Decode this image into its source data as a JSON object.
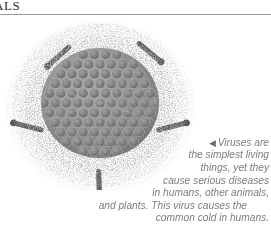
{
  "page": {
    "background_color": "#ffffff",
    "running_head": "ALS",
    "rule_color": "#9a9a9a"
  },
  "figure": {
    "name": "virus-illustration",
    "capsid_color": "#8a8a8a",
    "halo_color": "#b5b5b5",
    "capsomere_color": "#6f6f6f",
    "spike_color": "#555555",
    "spike_count": 5
  },
  "caption": {
    "arrow_glyph": "◀",
    "text_color": "#7c7c7c",
    "lines": [
      "Viruses are",
      "the simplest living",
      "things, yet they",
      "cause serious diseases",
      "in humans, other animals,",
      "and plants. This virus causes the",
      "common cold in humans."
    ],
    "full_text": "Viruses are the simplest living things, yet they cause serious diseases in humans, other animals, and plants. This virus causes the common cold in humans."
  }
}
